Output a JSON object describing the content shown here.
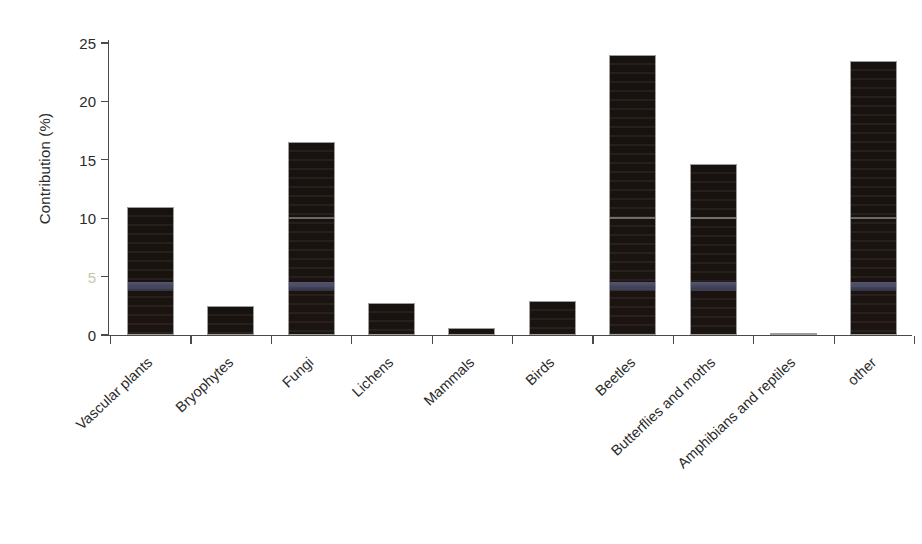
{
  "chart_data": {
    "type": "bar",
    "title": "",
    "subtitle": "",
    "xlabel": "",
    "ylabel": "Contribution (%)",
    "ylim": [
      0,
      25
    ],
    "yticks": [
      0,
      5,
      10,
      15,
      20,
      25
    ],
    "ytick_labels": [
      "0",
      "5",
      "10",
      "15",
      "20",
      "25"
    ],
    "grid": false,
    "legend": null,
    "bar_color": "#18120f",
    "bar_edge_color": "#9d9d9d",
    "categories": [
      "Vascular plants",
      "Bryophytes",
      "Fungi",
      "Lichens",
      "Mammals",
      "Birds",
      "Beetles",
      "Butterflies and moths",
      "Amphibians and reptiles",
      "other"
    ],
    "values": [
      11.0,
      2.5,
      16.5,
      2.7,
      0.6,
      2.9,
      24.0,
      14.6,
      0.2,
      23.5
    ]
  },
  "axes": {
    "y_axis_title": "Contribution (%)",
    "y_tick_0": "0",
    "y_tick_5": "5",
    "y_tick_10": "10",
    "y_tick_15": "15",
    "y_tick_20": "20",
    "y_tick_25": "25"
  },
  "category_labels": {
    "c0": "Vascular plants",
    "c1": "Bryophytes",
    "c2": "Fungi",
    "c3": "Lichens",
    "c4": "Mammals",
    "c5": "Birds",
    "c6": "Beetles",
    "c7": "Butterflies and moths",
    "c8": "Amphibians and reptiles",
    "c9": "other"
  }
}
